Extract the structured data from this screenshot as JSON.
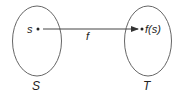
{
  "diagram": {
    "type": "function-mapping",
    "sets": [
      {
        "name": "S",
        "element": "s"
      },
      {
        "name": "T",
        "element": "f(s)"
      }
    ],
    "arrow": {
      "label": "f",
      "from": "s",
      "to": "f(s)"
    },
    "colors": {
      "stroke": "#555555",
      "text": "#222222",
      "background": "#ffffff"
    }
  }
}
